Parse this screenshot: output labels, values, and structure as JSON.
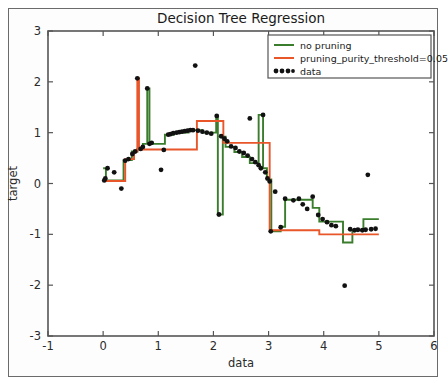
{
  "figure": {
    "title": "Decision Tree Regression"
  },
  "chart_data": {
    "type": "line",
    "title": "Decision Tree Regression",
    "xlabel": "data",
    "ylabel": "target",
    "xlim": [
      -1,
      6
    ],
    "ylim": [
      -3,
      3
    ],
    "xticks": [
      -1,
      0,
      1,
      2,
      3,
      4,
      5,
      6
    ],
    "xtick_labels": [
      "-1",
      "0",
      "1",
      "2",
      "3",
      "4",
      "5",
      "6"
    ],
    "yticks": [
      -3,
      -2,
      -1,
      0,
      1,
      2,
      3
    ],
    "ytick_labels": [
      "-3",
      "-2",
      "-1",
      "0",
      "1",
      "2",
      "3"
    ],
    "grid": false,
    "legend_position": "upper right",
    "legend": [
      {
        "label": "no pruning",
        "color": "#3a7d2c",
        "marker": "line"
      },
      {
        "label": "pruning_purity_threshold=0.05",
        "color": "#e8562a",
        "marker": "line"
      },
      {
        "label": "data",
        "color": "#111111",
        "marker": "dots"
      }
    ],
    "series": [
      {
        "name": "no pruning",
        "color": "#3a7d2c",
        "type": "step",
        "steps": [
          [
            0.0,
            0.3
          ],
          [
            0.05,
            0.3
          ],
          [
            0.05,
            0.06
          ],
          [
            0.37,
            0.06
          ],
          [
            0.37,
            0.46
          ],
          [
            0.52,
            0.46
          ],
          [
            0.52,
            0.63
          ],
          [
            0.62,
            0.63
          ],
          [
            0.62,
            0.68
          ],
          [
            0.72,
            0.68
          ],
          [
            0.72,
            0.78
          ],
          [
            0.8,
            0.78
          ],
          [
            0.8,
            1.87
          ],
          [
            0.84,
            1.87
          ],
          [
            0.84,
            0.78
          ],
          [
            1.12,
            0.78
          ],
          [
            1.12,
            0.96
          ],
          [
            1.28,
            0.96
          ],
          [
            1.28,
            1.0
          ],
          [
            1.55,
            1.0
          ],
          [
            1.55,
            1.05
          ],
          [
            1.8,
            1.05
          ],
          [
            1.8,
            1.0
          ],
          [
            2.05,
            1.0
          ],
          [
            2.05,
            1.33
          ],
          [
            2.08,
            1.33
          ],
          [
            2.08,
            -0.61
          ],
          [
            2.17,
            -0.61
          ],
          [
            2.17,
            0.92
          ],
          [
            2.22,
            0.92
          ],
          [
            2.22,
            0.72
          ],
          [
            2.38,
            0.72
          ],
          [
            2.38,
            0.62
          ],
          [
            2.52,
            0.62
          ],
          [
            2.52,
            0.52
          ],
          [
            2.66,
            0.52
          ],
          [
            2.66,
            0.4
          ],
          [
            2.82,
            0.4
          ],
          [
            2.82,
            1.35
          ],
          [
            2.9,
            1.35
          ],
          [
            2.9,
            0.3
          ],
          [
            2.97,
            0.3
          ],
          [
            2.97,
            0.08
          ],
          [
            3.05,
            0.08
          ],
          [
            3.05,
            -0.94
          ],
          [
            3.22,
            -0.94
          ],
          [
            3.22,
            -0.85
          ],
          [
            3.3,
            -0.85
          ],
          [
            3.3,
            -0.32
          ],
          [
            3.8,
            -0.32
          ],
          [
            3.8,
            -0.48
          ],
          [
            3.92,
            -0.48
          ],
          [
            3.92,
            -0.75
          ],
          [
            4.35,
            -0.75
          ],
          [
            4.35,
            -1.16
          ],
          [
            4.52,
            -1.16
          ],
          [
            4.52,
            -0.92
          ],
          [
            4.72,
            -0.92
          ],
          [
            4.72,
            -0.7
          ],
          [
            5.0,
            -0.7
          ]
        ]
      },
      {
        "name": "pruning_purity_threshold=0.05",
        "color": "#e8562a",
        "type": "step",
        "steps": [
          [
            0.0,
            0.05
          ],
          [
            0.4,
            0.05
          ],
          [
            0.4,
            0.48
          ],
          [
            0.56,
            0.48
          ],
          [
            0.56,
            0.63
          ],
          [
            0.62,
            0.63
          ],
          [
            0.62,
            2.07
          ],
          [
            0.65,
            2.07
          ],
          [
            0.65,
            0.67
          ],
          [
            1.7,
            0.67
          ],
          [
            1.7,
            1.23
          ],
          [
            2.18,
            1.23
          ],
          [
            2.18,
            0.8
          ],
          [
            3.02,
            0.8
          ],
          [
            3.02,
            -0.92
          ],
          [
            3.92,
            -0.92
          ],
          [
            3.92,
            -1.0
          ],
          [
            5.0,
            -1.0
          ]
        ]
      }
    ],
    "data_points": [
      [
        0.02,
        0.06
      ],
      [
        0.04,
        0.1
      ],
      [
        0.08,
        0.3
      ],
      [
        0.2,
        0.22
      ],
      [
        0.33,
        -0.1
      ],
      [
        0.4,
        0.45
      ],
      [
        0.46,
        0.48
      ],
      [
        0.53,
        0.58
      ],
      [
        0.58,
        0.63
      ],
      [
        0.62,
        2.07
      ],
      [
        0.68,
        0.68
      ],
      [
        0.72,
        0.72
      ],
      [
        0.8,
        1.87
      ],
      [
        0.84,
        0.78
      ],
      [
        0.88,
        0.8
      ],
      [
        1.05,
        0.27
      ],
      [
        1.1,
        0.66
      ],
      [
        1.18,
        0.96
      ],
      [
        1.22,
        0.97
      ],
      [
        1.27,
        0.99
      ],
      [
        1.33,
        1.0
      ],
      [
        1.38,
        1.01
      ],
      [
        1.43,
        1.02
      ],
      [
        1.48,
        1.03
      ],
      [
        1.53,
        1.04
      ],
      [
        1.58,
        1.05
      ],
      [
        1.63,
        1.05
      ],
      [
        1.67,
        2.32
      ],
      [
        1.72,
        1.04
      ],
      [
        1.8,
        1.02
      ],
      [
        1.88,
        1.0
      ],
      [
        1.96,
        0.98
      ],
      [
        2.06,
        1.33
      ],
      [
        2.1,
        -0.61
      ],
      [
        2.14,
        0.93
      ],
      [
        2.2,
        0.88
      ],
      [
        2.25,
        0.83
      ],
      [
        2.32,
        0.73
      ],
      [
        2.4,
        0.7
      ],
      [
        2.47,
        0.63
      ],
      [
        2.55,
        0.6
      ],
      [
        2.62,
        0.55
      ],
      [
        2.66,
        1.28
      ],
      [
        2.7,
        0.48
      ],
      [
        2.76,
        0.42
      ],
      [
        2.82,
        0.36
      ],
      [
        2.86,
        0.3
      ],
      [
        2.9,
        1.35
      ],
      [
        2.94,
        0.22
      ],
      [
        2.98,
        0.1
      ],
      [
        3.02,
        0.04
      ],
      [
        3.04,
        -0.94
      ],
      [
        3.12,
        -0.16
      ],
      [
        3.22,
        -0.86
      ],
      [
        3.3,
        -0.3
      ],
      [
        3.45,
        -0.33
      ],
      [
        3.55,
        -0.3
      ],
      [
        3.62,
        -0.41
      ],
      [
        3.7,
        -0.5
      ],
      [
        3.8,
        -0.26
      ],
      [
        3.9,
        -0.62
      ],
      [
        3.98,
        -0.7
      ],
      [
        4.06,
        -0.76
      ],
      [
        4.14,
        -0.82
      ],
      [
        4.22,
        -0.84
      ],
      [
        4.38,
        -2.01
      ],
      [
        4.48,
        -0.9
      ],
      [
        4.56,
        -0.92
      ],
      [
        4.62,
        -0.91
      ],
      [
        4.7,
        -0.92
      ],
      [
        4.76,
        -0.91
      ],
      [
        4.8,
        0.17
      ],
      [
        4.86,
        -0.9
      ],
      [
        4.94,
        -0.89
      ]
    ]
  }
}
